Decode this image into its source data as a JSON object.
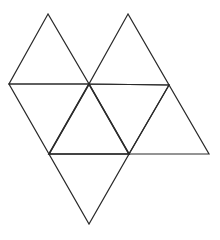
{
  "diagram": {
    "stroke_color": "#2a2a2a",
    "background": "#ffffff",
    "vertices": {
      "A": [
        48,
        14
      ],
      "B": [
        128,
        14
      ],
      "C": [
        9,
        84
      ],
      "D": [
        89,
        84
      ],
      "E": [
        169,
        85
      ],
      "F": [
        49,
        154
      ],
      "G": [
        129,
        154
      ],
      "H": [
        209,
        154
      ],
      "I": [
        89,
        224
      ]
    },
    "triangles": [
      {
        "id": "t1",
        "points": [
          "A",
          "C",
          "D"
        ]
      },
      {
        "id": "t2",
        "points": [
          "B",
          "D",
          "E"
        ]
      },
      {
        "id": "t3",
        "points": [
          "C",
          "D",
          "F"
        ]
      },
      {
        "id": "t4",
        "points": [
          "D",
          "F",
          "G"
        ],
        "emphasis": true
      },
      {
        "id": "t5",
        "points": [
          "D",
          "E",
          "G"
        ]
      },
      {
        "id": "t6",
        "points": [
          "E",
          "G",
          "H"
        ]
      },
      {
        "id": "t7",
        "points": [
          "F",
          "G",
          "I"
        ]
      }
    ]
  }
}
